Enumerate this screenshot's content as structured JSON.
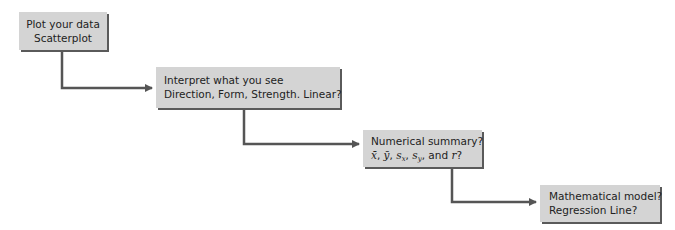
{
  "diagram": {
    "type": "stepwise-flowchart",
    "colors": {
      "box_fill": "#d4d4d4",
      "box_shadow": "#5a5a5a",
      "connector": "#555555",
      "text": "#222222"
    },
    "steps": [
      {
        "line1": "Plot your data",
        "line2": "Scatterplot"
      },
      {
        "line1": "Interpret what you see",
        "line2": "Direction, Form, Strength. Linear?"
      },
      {
        "line1": "Numerical summary?",
        "line2_parts": {
          "xbar": "x̄",
          "sep1": ", ",
          "ybar": "ȳ",
          "sep2": ", ",
          "sx_s": "s",
          "sx_sub": "x",
          "sep3": ", ",
          "sy_s": "s",
          "sy_sub": "y",
          "sep4": ", and ",
          "r": "r",
          "q": "?"
        }
      },
      {
        "line1": "Mathematical model?",
        "line2": "Regression Line?"
      }
    ],
    "connectors": [
      {
        "from": 1,
        "to": 2,
        "icon": "arrow-right-icon"
      },
      {
        "from": 2,
        "to": 3,
        "icon": "arrow-right-icon"
      },
      {
        "from": 3,
        "to": 4,
        "icon": "arrow-right-icon"
      }
    ]
  }
}
